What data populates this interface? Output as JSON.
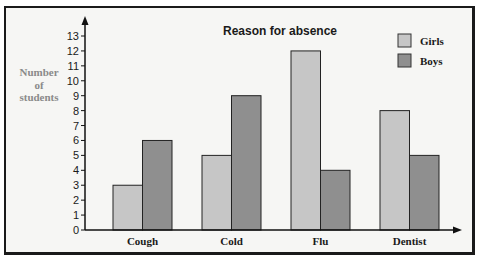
{
  "chart_data": {
    "type": "bar",
    "title": "Reason for absence",
    "xlabel": "",
    "ylabel": "Number of students",
    "ylabel_lines": [
      "Number",
      "of",
      "students"
    ],
    "categories": [
      "Cough",
      "Cold",
      "Flu",
      "Dentist"
    ],
    "series": [
      {
        "name": "Girls",
        "values": [
          3,
          5,
          12,
          8
        ],
        "color": "#c6c6c6"
      },
      {
        "name": "Boys",
        "values": [
          6,
          9,
          4,
          5
        ],
        "color": "#8f8f8f"
      }
    ],
    "yticks": [
      0,
      1,
      2,
      3,
      4,
      5,
      6,
      7,
      8,
      9,
      10,
      11,
      12,
      13
    ],
    "ylim": [
      0,
      13
    ],
    "grid": false,
    "legend_position": "top-right"
  },
  "colors": {
    "background": "#f6f6f4",
    "border": "#1a1a1a",
    "axis": "#111111",
    "ylabel_text": "#8a8a8a",
    "text": "#1a1a1a"
  }
}
